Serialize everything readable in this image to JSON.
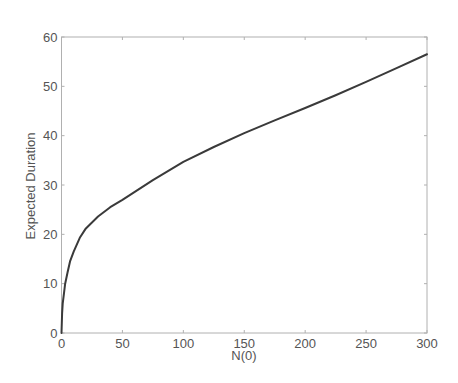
{
  "chart_data": {
    "type": "line",
    "title": "",
    "xlabel": "N(0)",
    "ylabel": "Expected Duration",
    "xlim": [
      0,
      300
    ],
    "ylim": [
      0,
      60
    ],
    "xticks": [
      0,
      50,
      100,
      150,
      200,
      250,
      300
    ],
    "yticks": [
      0,
      10,
      20,
      30,
      40,
      50,
      60
    ],
    "xtick_labels": [
      "0",
      "50",
      "100",
      "150",
      "200",
      "250",
      "300"
    ],
    "ytick_labels": [
      "0",
      "10",
      "20",
      "30",
      "40",
      "50",
      "60"
    ],
    "grid": false,
    "legend": null,
    "series": [
      {
        "name": "Expected Duration",
        "color": "#3a3a3a",
        "x": [
          0,
          0.5,
          1,
          2,
          3,
          5,
          7,
          10,
          15,
          20,
          30,
          40,
          50,
          75,
          100,
          125,
          150,
          175,
          200,
          225,
          250,
          275,
          300
        ],
        "y": [
          0,
          4,
          6,
          8,
          10,
          12.3,
          14.5,
          16.5,
          19.3,
          21.2,
          23.6,
          25.5,
          27.0,
          31.0,
          34.7,
          37.7,
          40.5,
          43.1,
          45.6,
          48.2,
          50.9,
          53.7,
          56.5
        ]
      }
    ]
  },
  "colors": {
    "axes": "#b0b0b0",
    "line": "#3a3a3a",
    "text": "#555555",
    "background": "#ffffff"
  }
}
